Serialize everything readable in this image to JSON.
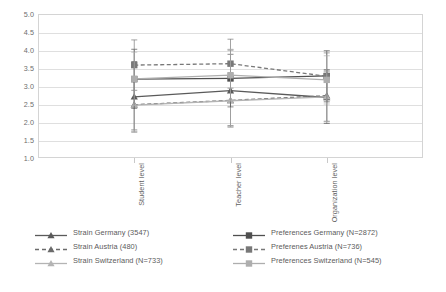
{
  "chart_data": {
    "type": "line",
    "title": "",
    "subtitle": "",
    "xlabel": "",
    "ylabel": "",
    "categories": [
      "Student level",
      "Teacher level",
      "Organization level"
    ],
    "ylim": [
      1.0,
      5.0
    ],
    "ytick_labels": [
      "5.0",
      "4.5",
      "4.0",
      "3.5",
      "3.0",
      "2.5",
      "2.0",
      "1.5",
      "1.0"
    ],
    "ytick_values": [
      5.0,
      4.5,
      4.0,
      3.5,
      3.0,
      2.5,
      2.0,
      1.5,
      1.0
    ],
    "grid": true,
    "legend_position": "bottom",
    "series": [
      {
        "name": "Strain Germany (3547)",
        "values": [
          2.7,
          2.87,
          2.68
        ],
        "error_low": [
          1.72,
          1.86,
          1.96
        ],
        "error_high": [
          3.68,
          3.88,
          3.42
        ],
        "marker": "triangle",
        "line_style": "solid",
        "color": "#5a5a5a"
      },
      {
        "name": "Strain Austria (480)",
        "values": [
          2.48,
          2.6,
          2.73
        ],
        "error_low": [
          1.78,
          1.9,
          2.02
        ],
        "error_high": [
          3.2,
          3.34,
          3.46
        ],
        "marker": "triangle",
        "line_style": "dashed",
        "color": "#6b6b6b"
      },
      {
        "name": "Strain Switzerland (N=733)",
        "values": [
          2.47,
          2.59,
          2.7
        ],
        "error_low": [
          1.74,
          1.88,
          2.0
        ],
        "error_high": [
          3.18,
          3.3,
          3.4
        ],
        "marker": "triangle",
        "line_style": "solid",
        "color": "#b4b4b4"
      },
      {
        "name": "Preferences Germany (N=2872)",
        "values": [
          3.19,
          3.21,
          3.28
        ],
        "error_low": [
          2.38,
          2.42,
          2.56
        ],
        "error_high": [
          4.02,
          4.0,
          3.98
        ],
        "marker": "square",
        "line_style": "solid",
        "color": "#4f4f4f"
      },
      {
        "name": "Preferenes Austria (N=736)",
        "values": [
          3.58,
          3.62,
          3.27
        ],
        "error_low": [
          2.88,
          2.94,
          2.62
        ],
        "error_high": [
          4.28,
          4.3,
          3.92
        ],
        "marker": "square",
        "line_style": "dashed",
        "color": "#787878"
      },
      {
        "name": "Preferences Switzerland (N=545)",
        "values": [
          3.2,
          3.3,
          3.17
        ],
        "error_low": [
          2.46,
          2.58,
          2.5
        ],
        "error_high": [
          3.94,
          4.02,
          3.84
        ],
        "marker": "square",
        "line_style": "solid",
        "color": "#aeaeae"
      }
    ]
  },
  "legend": {
    "columns": [
      {
        "entries": [
          "Strain Germany (3547)",
          "Strain Austria (480)",
          "Strain Switzerland (N=733)"
        ]
      },
      {
        "entries": [
          "Preferences Germany (N=2872)",
          "Preferenes Austria (N=736)",
          "Preferences Switzerland (N=545)"
        ]
      }
    ]
  }
}
